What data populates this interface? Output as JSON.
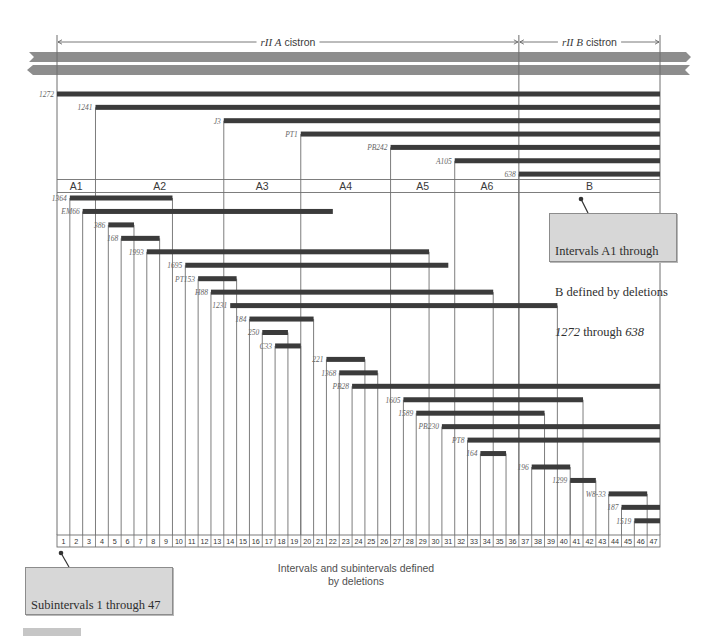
{
  "caption": {
    "line1": "Intervals and subintervals defined",
    "line2": "by deletions"
  },
  "callouts": {
    "intervals": {
      "line1": "Intervals A1 through",
      "line2": "B defined by deletions",
      "line3_a": "1272",
      "line3_b": " through ",
      "line3_c": "638"
    },
    "subintervals": {
      "line1": "Subintervals 1 through 47",
      "line2_a": "defined by deletions ",
      "line2_b": "1364",
      "line3_a": "through ",
      "line3_b": "1519"
    }
  },
  "colors": {
    "deletion_bar": "#3b3b3b",
    "dna_band": "#8d8d8d",
    "line": "#6e6e6e",
    "callout_fill": "#d7d7d7"
  },
  "chart_data": {
    "type": "deletion-map",
    "title": "Intervals and subintervals defined by deletions",
    "axis": {
      "subinterval_count": 47,
      "subinterval_labels": [
        "1",
        "2",
        "3",
        "4",
        "5",
        "6",
        "7",
        "8",
        "9",
        "10",
        "11",
        "12",
        "13",
        "14",
        "15",
        "16",
        "17",
        "18",
        "19",
        "20",
        "21",
        "22",
        "23",
        "24",
        "25",
        "26",
        "27",
        "28",
        "29",
        "30",
        "31",
        "32",
        "33",
        "34",
        "35",
        "36",
        "37",
        "38",
        "39",
        "40",
        "41",
        "42",
        "43",
        "44",
        "45",
        "46",
        "47"
      ]
    },
    "cistrons": [
      {
        "name": "rII A",
        "suffix": "cistron",
        "start": 0,
        "end": 36
      },
      {
        "name": "rII B",
        "suffix": "cistron",
        "start": 36,
        "end": 47
      }
    ],
    "intervals": [
      {
        "label": "A1",
        "start": 0,
        "end": 3
      },
      {
        "label": "A2",
        "start": 3,
        "end": 13
      },
      {
        "label": "A3",
        "start": 13,
        "end": 19
      },
      {
        "label": "A4",
        "start": 19,
        "end": 26
      },
      {
        "label": "A5",
        "start": 26,
        "end": 31
      },
      {
        "label": "A6",
        "start": 31,
        "end": 36
      },
      {
        "label": "B",
        "start": 36,
        "end": 47
      }
    ],
    "interval_deletions": [
      {
        "name": "1272",
        "start": 0,
        "end": 47
      },
      {
        "name": "1241",
        "start": 3,
        "end": 47
      },
      {
        "name": "J3",
        "start": 13,
        "end": 47
      },
      {
        "name": "PT1",
        "start": 19,
        "end": 47
      },
      {
        "name": "PB242",
        "start": 26,
        "end": 47
      },
      {
        "name": "A105",
        "start": 31,
        "end": 47
      },
      {
        "name": "638",
        "start": 36,
        "end": 47
      }
    ],
    "subinterval_deletions": [
      {
        "name": "1364",
        "start": 1,
        "end": 9
      },
      {
        "name": "EM66",
        "start": 2,
        "end": 21.5
      },
      {
        "name": "386",
        "start": 4,
        "end": 6
      },
      {
        "name": "168",
        "start": 5,
        "end": 8
      },
      {
        "name": "1993",
        "start": 7,
        "end": 29
      },
      {
        "name": "1695",
        "start": 10,
        "end": 30.5
      },
      {
        "name": "PT153",
        "start": 11,
        "end": 14
      },
      {
        "name": "H88",
        "start": 12,
        "end": 34
      },
      {
        "name": "1231",
        "start": 13.5,
        "end": 39
      },
      {
        "name": "184",
        "start": 15,
        "end": 20
      },
      {
        "name": "250",
        "start": 16,
        "end": 18
      },
      {
        "name": "C33",
        "start": 17,
        "end": 19
      },
      {
        "name": "221",
        "start": 21,
        "end": 24
      },
      {
        "name": "1368",
        "start": 22,
        "end": 25
      },
      {
        "name": "PB28",
        "start": 23,
        "end": 47
      },
      {
        "name": "1605",
        "start": 27,
        "end": 41
      },
      {
        "name": "1589",
        "start": 28,
        "end": 38
      },
      {
        "name": "PB230",
        "start": 30,
        "end": 47
      },
      {
        "name": "PT8",
        "start": 32,
        "end": 47
      },
      {
        "name": "164",
        "start": 33,
        "end": 35
      },
      {
        "name": "196",
        "start": 37,
        "end": 40
      },
      {
        "name": "1299",
        "start": 40,
        "end": 42
      },
      {
        "name": "W8-33",
        "start": 43,
        "end": 46
      },
      {
        "name": "187",
        "start": 44,
        "end": 47
      },
      {
        "name": "1519",
        "start": 45,
        "end": 47
      }
    ]
  }
}
